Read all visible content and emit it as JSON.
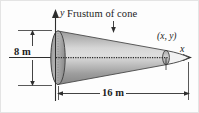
{
  "figure": {
    "title_label": "Frustum of cone",
    "labels": {
      "height_dimension": "8 m",
      "length_dimension": "16 m",
      "axis_y": "y",
      "axis_x": "x",
      "point": "(x, y)"
    },
    "colors": {
      "solid_light": "#d4d4d4",
      "solid_mid": "#a8a8a8",
      "solid_dark": "#8a8a8a",
      "outline": "#3a3a3a",
      "background": "#fdfdfd",
      "border": "#e2e2e2"
    },
    "geometry": {
      "shape": "frustum-of-cone",
      "height_m": 8,
      "length_m": 16,
      "axis_origin_label": "origin at left face center",
      "apex_marker": "(x, y)"
    }
  }
}
